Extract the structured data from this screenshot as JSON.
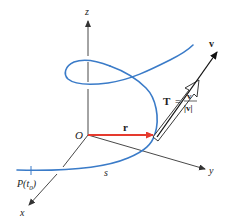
{
  "figure": {
    "type": "vector-calculus-diagram",
    "colors": {
      "curve": "#3a7bc8",
      "position_vector": "#e53a2e",
      "axes": "#333333",
      "velocity": "#111111",
      "background": "#ffffff"
    },
    "axes": {
      "x_label": "x",
      "y_label": "y",
      "z_label": "z",
      "origin_label": "O"
    },
    "vectors": {
      "position_label": "r",
      "velocity_label": "v",
      "tangent_label": "T",
      "tangent_equals": "=",
      "tangent_numerator": "v",
      "tangent_denominator": "|v|"
    },
    "curve": {
      "start_point_label": "P(t",
      "start_point_subscript": "0",
      "start_point_close": ")",
      "arc_length_label": "s"
    }
  }
}
